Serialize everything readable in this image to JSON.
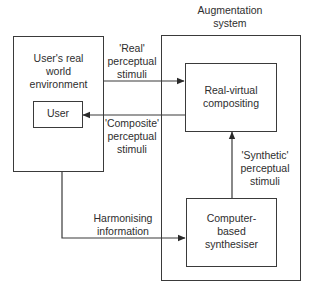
{
  "diagram": {
    "augmentation_title": "Augmentation\nsystem",
    "nodes": {
      "real_world": "User's real\nworld\nenvironment",
      "user": "User",
      "compositing": "Real-virtual\ncompositing",
      "synthesiser": "Computer-\nbased\nsynthesiser"
    },
    "edges": {
      "real_stimuli": "'Real'\nperceptual\nstimuli",
      "composite_stimuli": "'Composite'\nperceptual\nstimuli",
      "synthetic_stimuli": "'Synthetic'\nperceptual\nstimuli",
      "harmonising": "Harmonising\ninformation"
    },
    "colors": {
      "line": "#3a3a3a",
      "text": "#2e2e2e",
      "background": "#ffffff"
    }
  }
}
